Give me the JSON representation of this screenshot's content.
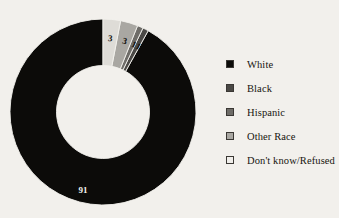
{
  "background_color": "#f2f0ec",
  "chart_data": {
    "type": "pie",
    "variant": "donut",
    "title": "",
    "subtitle": "",
    "xlabel": "",
    "ylabel": "",
    "legend_position": "right",
    "grid": false,
    "total": 99,
    "units": "percent",
    "start_angle_deg": 0,
    "direction": "counterclockwise",
    "inner_radius_ratio": 0.5,
    "categories": [
      "White",
      "Black",
      "Hispanic",
      "Other Race",
      "Don't know/Refused"
    ],
    "values": [
      91,
      1,
      1,
      3,
      3
    ],
    "colors": [
      "#0c0b09",
      "#4a4845",
      "#6e6c68",
      "#a9a7a2",
      "#dedcd7"
    ],
    "data_labels": [
      "91",
      "1",
      "1",
      "3",
      "3"
    ],
    "slices": [
      {
        "label": "White",
        "value": 91,
        "data_label": "91",
        "color": "#0c0b09",
        "label_color": "light"
      },
      {
        "label": "Black",
        "value": 1,
        "data_label": "1",
        "color": "#4a4845",
        "label_color": "dark"
      },
      {
        "label": "Hispanic",
        "value": 1,
        "data_label": "1",
        "color": "#6e6c68",
        "label_color": "dark"
      },
      {
        "label": "Other Race",
        "value": 3,
        "data_label": "3",
        "color": "#a9a7a2",
        "label_color": "dark"
      },
      {
        "label": "Don't know/Refused",
        "value": 3,
        "data_label": "3",
        "color": "#dedcd7",
        "label_color": "dark"
      }
    ]
  },
  "legend": {
    "items": [
      {
        "label": "White",
        "color": "#0c0b09"
      },
      {
        "label": "Black",
        "color": "#4a4845"
      },
      {
        "label": "Hispanic",
        "color": "#6e6c68"
      },
      {
        "label": "Other Race",
        "color": "#a9a7a2"
      },
      {
        "label": "Don't know/Refused",
        "color": "#f0eeea"
      }
    ]
  }
}
